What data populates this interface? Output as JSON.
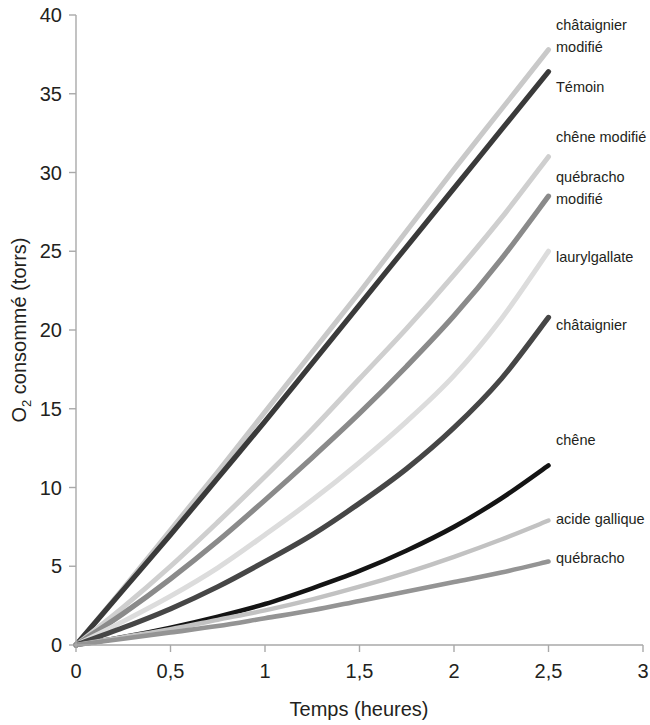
{
  "chart_data": {
    "type": "line",
    "title": "",
    "xlabel": "Temps (heures)",
    "ylabel": "O2 consommé (torrs)",
    "ylabel_base": "O",
    "ylabel_sub": "2",
    "ylabel_rest": " consommé (torrs)",
    "xlim": [
      0,
      3
    ],
    "ylim": [
      0,
      40
    ],
    "grid": false,
    "legend_position": "right-inline-labels",
    "xticks": [
      0,
      0.5,
      1,
      1.5,
      2,
      2.5,
      3
    ],
    "xtick_labels": [
      "0",
      "0,5",
      "1",
      "1,5",
      "2",
      "2,5",
      "3"
    ],
    "yticks": [
      0,
      5,
      10,
      15,
      20,
      25,
      30,
      35,
      40
    ],
    "ytick_labels": [
      "0",
      "5",
      "10",
      "15",
      "20",
      "25",
      "30",
      "35",
      "40"
    ],
    "x": [
      0,
      0.25,
      0.5,
      0.75,
      1,
      1.25,
      1.5,
      1.75,
      2,
      2.25,
      2.5
    ],
    "series": [
      {
        "name": "châtaignier modifié",
        "label": "châtaignier modifié",
        "label_line1": "châtaignier",
        "label_line2": "modifié",
        "color": "#c9c9c9",
        "width": 5.0,
        "values": [
          0,
          3.6,
          7.3,
          11.0,
          14.8,
          18.6,
          22.4,
          26.3,
          30.2,
          34.0,
          37.8
        ]
      },
      {
        "name": "Témoin",
        "label": "Témoin",
        "label_line1": "Témoin",
        "label_line2": "",
        "color": "#3a3a3a",
        "width": 5.2,
        "values": [
          0,
          3.5,
          7.0,
          10.6,
          14.2,
          17.9,
          21.6,
          25.3,
          29.0,
          32.7,
          36.4
        ]
      },
      {
        "name": "chêne modifié",
        "label": "chêne modifié",
        "label_line1": "chêne modifié",
        "label_line2": "",
        "color": "#cfcfcf",
        "width": 5.0,
        "values": [
          0,
          2.4,
          5.0,
          7.8,
          10.7,
          13.7,
          16.9,
          20.1,
          23.5,
          27.1,
          31.0
        ]
      },
      {
        "name": "québracho modifié",
        "label": "québracho modifié",
        "label_line1": "québracho",
        "label_line2": "modifié",
        "color": "#8a8a8a",
        "width": 5.2,
        "values": [
          0,
          2.0,
          4.2,
          6.6,
          9.2,
          11.9,
          14.7,
          17.7,
          20.9,
          24.5,
          28.5
        ]
      },
      {
        "name": "laurylgallate",
        "label": "laurylgallate",
        "label_line1": "laurylgallate",
        "label_line2": "",
        "color": "#dcdcdc",
        "width": 5.0,
        "values": [
          0,
          1.5,
          3.1,
          4.9,
          7.0,
          9.2,
          11.6,
          14.2,
          17.1,
          20.7,
          25.0
        ]
      },
      {
        "name": "châtaignier",
        "label": "châtaignier",
        "label_line1": "châtaignier",
        "label_line2": "",
        "color": "#464646",
        "width": 5.2,
        "values": [
          0,
          1.1,
          2.3,
          3.7,
          5.3,
          7.0,
          9.0,
          11.2,
          13.8,
          16.9,
          20.8
        ]
      },
      {
        "name": "chêne",
        "label": "chêne",
        "label_line1": "chêne",
        "label_line2": "",
        "color": "#141414",
        "width": 4.6,
        "values": [
          0,
          0.5,
          1.1,
          1.8,
          2.6,
          3.6,
          4.7,
          6.0,
          7.5,
          9.3,
          11.4
        ]
      },
      {
        "name": "acide gallique",
        "label": "acide gallique",
        "label_line1": "acide gallique",
        "label_line2": "",
        "color": "#c2c2c2",
        "width": 4.4,
        "values": [
          0,
          0.5,
          1.0,
          1.6,
          2.2,
          2.9,
          3.7,
          4.6,
          5.6,
          6.7,
          7.9
        ]
      },
      {
        "name": "québracho",
        "label": "québracho",
        "label_line1": "québracho",
        "label_line2": "",
        "color": "#949494",
        "width": 4.6,
        "values": [
          0,
          0.4,
          0.8,
          1.2,
          1.7,
          2.2,
          2.8,
          3.4,
          4.0,
          4.6,
          5.3
        ]
      }
    ]
  },
  "layout": {
    "plot_left_px": 76,
    "plot_right_px": 643,
    "plot_top_px": 15,
    "plot_bottom_px": 645
  }
}
